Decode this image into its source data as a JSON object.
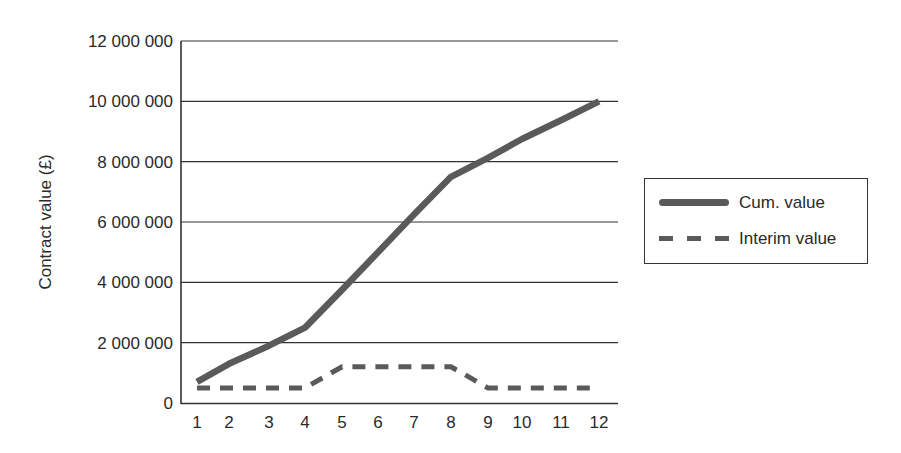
{
  "chart_data": {
    "type": "line",
    "title": "",
    "xlabel": "",
    "ylabel": "Contract value (£)",
    "x": [
      1,
      2,
      3,
      4,
      5,
      6,
      7,
      8,
      9,
      10,
      11,
      12
    ],
    "x_tick_labels": [
      "1",
      "2",
      "3",
      "4",
      "5",
      "6",
      "7",
      "8",
      "9",
      "10",
      "11",
      "12"
    ],
    "y_tick_labels": [
      "0",
      "2 000 000",
      "4 000 000",
      "6 000 000",
      "8 000 000",
      "10 000 000",
      "12 000 000"
    ],
    "y_ticks": [
      0,
      2000000,
      4000000,
      6000000,
      8000000,
      10000000,
      12000000
    ],
    "ylim": [
      0,
      12000000
    ],
    "grid": "horizontal",
    "legend_position": "right",
    "series": [
      {
        "name": "Cum. value",
        "style": "solid-thick",
        "color": "#5a5a5a",
        "values": [
          700000,
          1300000,
          1900000,
          2500000,
          3750000,
          5000000,
          6250000,
          7500000,
          8125000,
          8750000,
          9375000,
          10000000
        ]
      },
      {
        "name": "Interim value",
        "style": "dashed",
        "color": "#5a5a5a",
        "values": [
          500000,
          500000,
          500000,
          500000,
          1200000,
          1200000,
          1200000,
          1200000,
          500000,
          500000,
          500000,
          500000
        ]
      }
    ]
  },
  "legend": {
    "items": [
      {
        "label": "Cum. value"
      },
      {
        "label": "Interim value"
      }
    ]
  }
}
